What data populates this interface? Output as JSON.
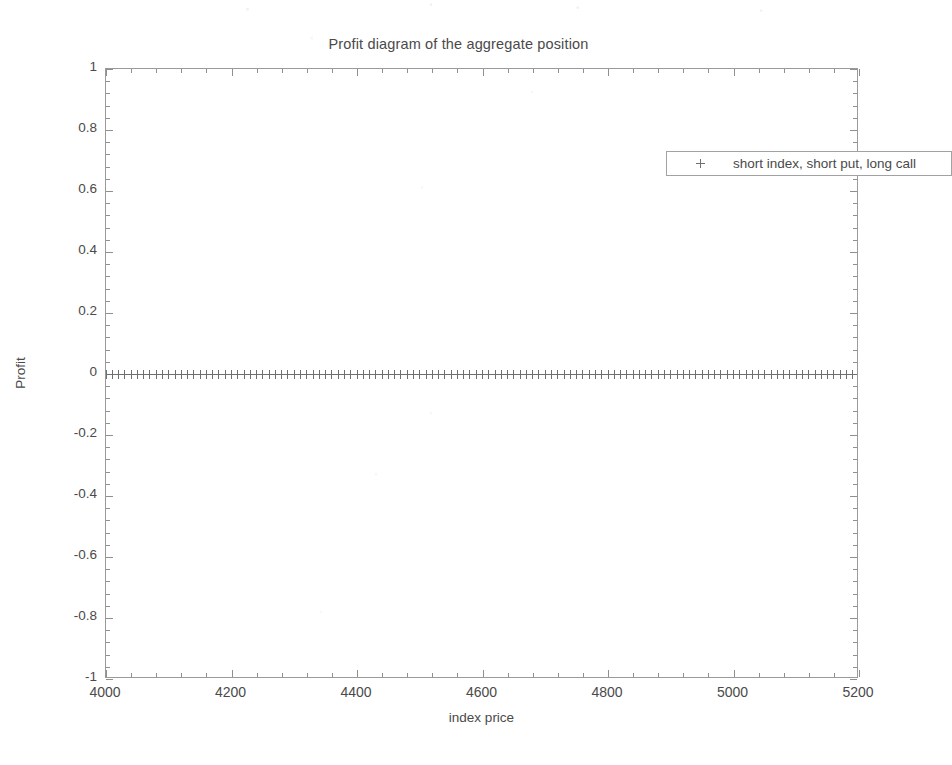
{
  "chart_data": {
    "type": "scatter",
    "title": "Profit diagram of the aggregate position",
    "xlabel": "index price",
    "ylabel": "Profit",
    "xlim": [
      4000,
      5200
    ],
    "ylim": [
      -1,
      1
    ],
    "xticks": [
      4000,
      4200,
      4400,
      4600,
      4800,
      5000,
      5200
    ],
    "xtick_labels": [
      "4000",
      "4200",
      "4400",
      "4600",
      "4800",
      "5000",
      "5200"
    ],
    "yticks": [
      -1,
      -0.8,
      -0.6,
      -0.4,
      -0.2,
      0,
      0.2,
      0.4,
      0.6,
      0.8,
      1
    ],
    "ytick_labels": [
      "-1",
      "-0.8",
      "-0.6",
      "-0.4",
      "-0.2",
      "0",
      "0.2",
      "0.4",
      "0.6",
      "0.8",
      "1"
    ],
    "grid": false,
    "legend_position": "top-right-inside",
    "marker": "+",
    "marker_color": "#6f6f6f",
    "series": [
      {
        "name": "short index, short put, long call",
        "marker": "+",
        "x_start": 4000,
        "x_end": 5200,
        "x_step": 10,
        "constant_y": 0,
        "values": [
          0,
          0,
          0,
          0,
          0,
          0,
          0,
          0,
          0,
          0,
          0,
          0,
          0,
          0,
          0,
          0,
          0,
          0,
          0,
          0,
          0,
          0,
          0,
          0,
          0,
          0,
          0,
          0,
          0,
          0,
          0,
          0,
          0,
          0,
          0,
          0,
          0,
          0,
          0,
          0,
          0,
          0,
          0,
          0,
          0,
          0,
          0,
          0,
          0,
          0,
          0,
          0,
          0,
          0,
          0,
          0,
          0,
          0,
          0,
          0,
          0,
          0,
          0,
          0,
          0,
          0,
          0,
          0,
          0,
          0,
          0,
          0,
          0,
          0,
          0,
          0,
          0,
          0,
          0,
          0,
          0,
          0,
          0,
          0,
          0,
          0,
          0,
          0,
          0,
          0,
          0,
          0,
          0,
          0,
          0,
          0,
          0,
          0,
          0,
          0,
          0,
          0,
          0,
          0,
          0,
          0,
          0,
          0,
          0,
          0,
          0,
          0,
          0,
          0,
          0,
          0,
          0,
          0,
          0,
          0,
          0
        ]
      }
    ]
  },
  "legend": {
    "marker_glyph": "+",
    "entries": [
      {
        "label": "short index, short put, long call"
      }
    ]
  }
}
